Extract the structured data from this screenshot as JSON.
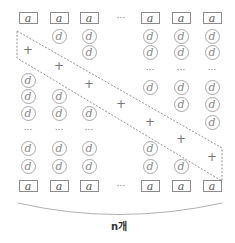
{
  "diagram": {
    "cell_a_label": "a",
    "cell_d_label": "d",
    "plus_label": "+",
    "ellipsis_label": "···",
    "count_label": "n개",
    "columns_x": [
      28,
      59,
      89,
      121,
      150,
      181,
      212
    ],
    "rows_y": {
      "top_a": 18,
      "r1": 36,
      "r2": 52,
      "r3": 70,
      "r4": 87,
      "r5": 104,
      "r6": 122,
      "dots_lower": 130,
      "r7": 148,
      "r8": 166,
      "bottom_a": 186
    },
    "columns": [
      {
        "name": "col-1",
        "top": "a",
        "cells": [
          {
            "y": 80,
            "t": "d"
          },
          {
            "y": 96,
            "t": "d"
          },
          {
            "y": 113,
            "t": "d"
          },
          {
            "y": 130,
            "t": "dots"
          },
          {
            "y": 148,
            "t": "d"
          },
          {
            "y": 166,
            "t": "d"
          }
        ],
        "plus_y": 50,
        "bottom": "a"
      },
      {
        "name": "col-2",
        "top": "a",
        "cells": [
          {
            "y": 36,
            "t": "d"
          },
          {
            "y": 96,
            "t": "d"
          },
          {
            "y": 113,
            "t": "d"
          },
          {
            "y": 130,
            "t": "dots"
          },
          {
            "y": 148,
            "t": "d"
          },
          {
            "y": 166,
            "t": "d"
          }
        ],
        "plus_y": 66,
        "bottom": "a"
      },
      {
        "name": "col-3",
        "top": "a",
        "cells": [
          {
            "y": 36,
            "t": "d"
          },
          {
            "y": 52,
            "t": "d"
          },
          {
            "y": 113,
            "t": "d"
          },
          {
            "y": 130,
            "t": "dots"
          },
          {
            "y": 148,
            "t": "d"
          },
          {
            "y": 166,
            "t": "d"
          }
        ],
        "plus_y": 84,
        "bottom": "a"
      },
      {
        "name": "col-ellipsis",
        "top": "dots",
        "cells": [],
        "plus_y": 104,
        "bottom": "dots"
      },
      {
        "name": "col-5",
        "top": "a",
        "cells": [
          {
            "y": 36,
            "t": "d"
          },
          {
            "y": 52,
            "t": "d"
          },
          {
            "y": 70,
            "t": "dots"
          },
          {
            "y": 87,
            "t": "d"
          },
          {
            "y": 148,
            "t": "d"
          },
          {
            "y": 166,
            "t": "d"
          }
        ],
        "plus_y": 122,
        "bottom": "a"
      },
      {
        "name": "col-6",
        "top": "a",
        "cells": [
          {
            "y": 36,
            "t": "d"
          },
          {
            "y": 52,
            "t": "d"
          },
          {
            "y": 70,
            "t": "dots"
          },
          {
            "y": 87,
            "t": "d"
          },
          {
            "y": 104,
            "t": "d"
          },
          {
            "y": 166,
            "t": "d"
          }
        ],
        "plus_y": 139,
        "bottom": "a"
      },
      {
        "name": "col-7",
        "top": "a",
        "cells": [
          {
            "y": 36,
            "t": "d"
          },
          {
            "y": 52,
            "t": "d"
          },
          {
            "y": 70,
            "t": "dots"
          },
          {
            "y": 87,
            "t": "d"
          },
          {
            "y": 104,
            "t": "d"
          },
          {
            "y": 122,
            "t": "d"
          }
        ],
        "plus_y": 157,
        "bottom": "a"
      }
    ],
    "band_polygon": "17,31 222,148 222,181 17,58",
    "colors": {
      "box_border": "#8c8c8c",
      "circle_border": "#a8a8a8",
      "dash": "#777777",
      "arc": "#9a9a9a",
      "text": "#555555"
    }
  }
}
